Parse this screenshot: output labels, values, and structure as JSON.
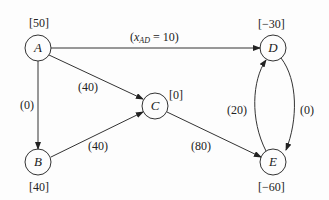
{
  "nodes": {
    "A": {
      "label": "A",
      "supply": "[50]"
    },
    "B": {
      "label": "B",
      "supply": "[40]"
    },
    "C": {
      "label": "C",
      "supply": "[0]"
    },
    "D": {
      "label": "D",
      "supply": "[−30]"
    },
    "E": {
      "label": "E",
      "supply": "[−60]"
    }
  },
  "edges": {
    "AD": {
      "var": "x",
      "sub": "AD",
      "eq": " = 10)",
      "open": "("
    },
    "AC": {
      "flow": "(40)"
    },
    "AB": {
      "flow": "(0)"
    },
    "BC": {
      "flow": "(40)"
    },
    "CE": {
      "flow": "(80)"
    },
    "ED": {
      "flow": "(20)"
    },
    "DE": {
      "flow": "(0)"
    }
  },
  "colors": {
    "stroke": "#333333",
    "text": "#222222",
    "background": "#fdfdfd"
  }
}
